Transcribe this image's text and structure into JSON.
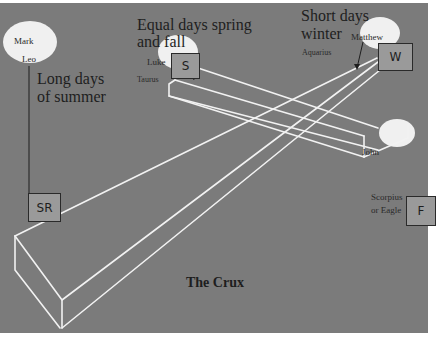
{
  "diagram": {
    "title": "The Crux",
    "colors": {
      "background": "#7b7b7b",
      "beam_lines": "#f2f2f2",
      "ellipse_fill": "#f0f0f0",
      "box_fill": "#9a9a9a",
      "text": "#1e1e1e"
    },
    "seasons": {
      "summer": {
        "caption_line1": "Long days",
        "caption_line2": "of summer",
        "box_label": "SR",
        "apostle": "Mark",
        "sign": "Leo"
      },
      "equinox": {
        "caption_line1": "Equal days spring",
        "caption_line2": "and fall",
        "box_label": "S",
        "apostle": "Luke",
        "sign": "Taurus"
      },
      "winter": {
        "caption_line1": "Short days",
        "caption_line2": "winter",
        "box_label": "W",
        "apostle": "Matthew",
        "sign": "Aquarius"
      },
      "fall": {
        "box_label": "F",
        "apostle": "John",
        "sign_line1": "Scorpius",
        "sign_line2": "or Eagle"
      }
    }
  }
}
